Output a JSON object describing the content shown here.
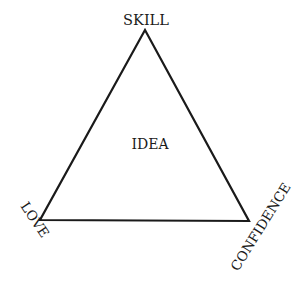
{
  "diagram": {
    "type": "triangle",
    "center_label": "IDEA",
    "vertices": {
      "top": {
        "label": "SKILL",
        "x": 145,
        "y": 30
      },
      "bottom_left": {
        "label": "LOVE",
        "x": 40,
        "y": 220
      },
      "bottom_right": {
        "label": "CONFIDENCE",
        "x": 249,
        "y": 221
      }
    },
    "colors": {
      "stroke": "#1a1a1a",
      "background": "#ffffff"
    }
  }
}
